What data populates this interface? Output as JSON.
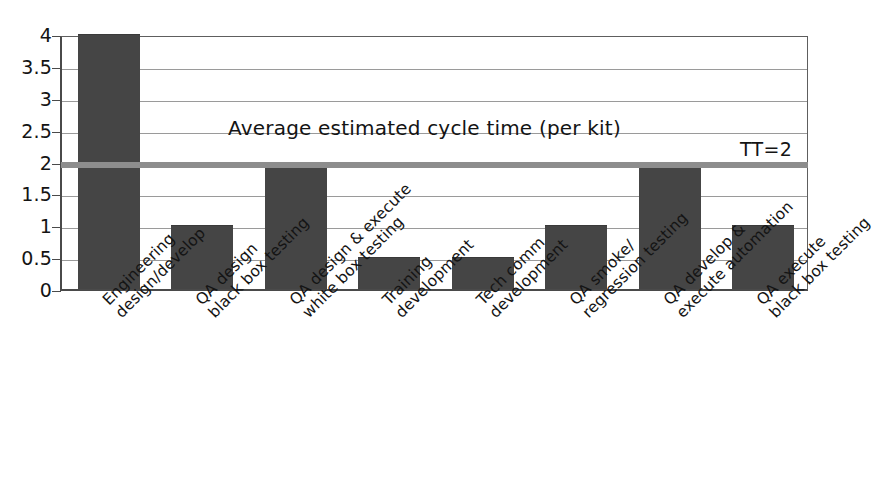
{
  "chart_data": {
    "type": "bar",
    "title": "",
    "annotation": "Average estimated cycle time (per kit)",
    "xlabel": "",
    "ylabel": "",
    "ylim": [
      0,
      4
    ],
    "ytick_labels": [
      "4",
      "3.5",
      "3",
      "2.5",
      "2",
      "1.5",
      "1",
      "0.5",
      "0"
    ],
    "ytick_values": [
      4,
      3.5,
      3,
      2.5,
      2,
      1.5,
      1,
      0.5,
      0
    ],
    "grid": true,
    "legend": "none",
    "categories": [
      "Engineering design/develop",
      "QA design black box testing",
      "QA design & execute white box testing",
      "Training development",
      "Tech comm development",
      "QA smoke/ regression testing",
      "QA develop & execute automation",
      "QA execute black box testing"
    ],
    "category_lines": [
      [
        "Engineering",
        "design/develop"
      ],
      [
        "QA design",
        "black box testing"
      ],
      [
        "QA design & execute",
        "white box testing"
      ],
      [
        "Training",
        "development"
      ],
      [
        "Tech comm",
        "development"
      ],
      [
        "QA smoke/",
        "regression testing"
      ],
      [
        "QA develop &",
        "execute automation"
      ],
      [
        "QA execute",
        "black box testing"
      ]
    ],
    "values": [
      4,
      1,
      2,
      0.5,
      0.5,
      1,
      2,
      1
    ],
    "reference_line": {
      "label": "TT=2",
      "value": 2,
      "color": "#8d8d8d"
    },
    "bar_color": "#454545",
    "grid_color": "#9a9a9a",
    "axis_color": "#4a4a4a"
  }
}
